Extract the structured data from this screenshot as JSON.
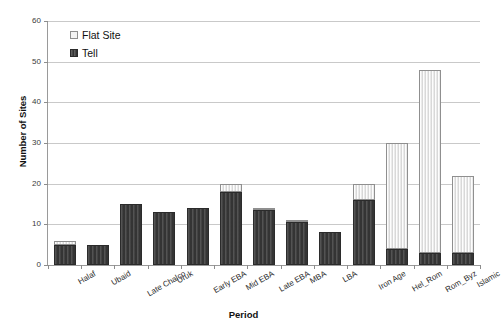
{
  "chart_data": {
    "type": "bar",
    "title": "",
    "subtitle": "",
    "xlabel": "Period",
    "ylabel": "Number of Sites",
    "ylim": [
      0,
      60
    ],
    "yticks": [
      0,
      10,
      20,
      30,
      40,
      50,
      60
    ],
    "ytick_labels": [
      "0",
      "10",
      "20",
      "30",
      "40",
      "50",
      "60"
    ],
    "grid": "horizontal",
    "stacked": true,
    "legend_position": "inside-top-left",
    "categories": [
      "Halaf",
      "Ubaid",
      "Late Chalco",
      "Uruk",
      "Early EBA",
      "Mid EBA",
      "Late EBA",
      "MBA",
      "LBA",
      "Iron Age",
      "Hel_Rom",
      "Rom_Byz",
      "Islamic"
    ],
    "series": [
      {
        "name": "Tell",
        "color": "#3a3a3a",
        "values": [
          5,
          5,
          15,
          13,
          14,
          18,
          13.5,
          10.5,
          8,
          16,
          4,
          3,
          3
        ]
      },
      {
        "name": "Flat Site",
        "color": "#ebebeb",
        "values": [
          1,
          0,
          0,
          0,
          0,
          2,
          0.5,
          0.5,
          0,
          4,
          26,
          45,
          19
        ]
      }
    ],
    "totals": [
      6,
      5,
      15,
      13,
      14,
      20,
      14,
      11,
      8,
      20,
      30,
      48,
      22
    ]
  },
  "legend": {
    "entries": [
      {
        "label": "Flat Site",
        "swatch": "flat-site-swatch"
      },
      {
        "label": "Tell",
        "swatch": "tell-swatch"
      }
    ]
  },
  "axes": {
    "y_title": "Number of Sites",
    "x_title": "Period"
  }
}
